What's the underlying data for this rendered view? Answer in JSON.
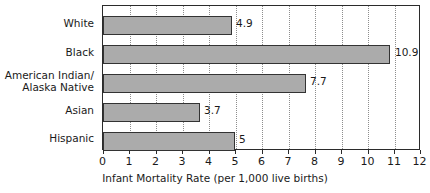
{
  "chart_data": {
    "type": "bar",
    "orientation": "horizontal",
    "title": "",
    "xlabel": "Infant Mortality Rate (per 1,000 live births)",
    "ylabel": "",
    "categories": [
      "White",
      "Black",
      "American Indian/\nAlaska Native",
      "Asian",
      "Hispanic"
    ],
    "values": [
      4.9,
      10.9,
      7.7,
      3.7,
      5
    ],
    "value_labels": [
      "4.9",
      "10.9",
      "7.7",
      "3.7",
      "5"
    ],
    "xlim": [
      0,
      12
    ],
    "xticks": [
      0,
      1,
      2,
      3,
      4,
      5,
      6,
      7,
      8,
      9,
      10,
      11,
      12
    ],
    "xtick_labels": [
      "0",
      "1",
      "2",
      "3",
      "4",
      "5",
      "6",
      "7",
      "8",
      "9",
      "10",
      "11",
      "12"
    ],
    "grid": "vertical-dotted",
    "legend": "none",
    "bar_fill_color": "#ababab",
    "bar_border_color": "#333333",
    "grid_color": "#8d8d8d",
    "frame_color": "#2b2b2b",
    "text_color": "#1a1a1a"
  }
}
